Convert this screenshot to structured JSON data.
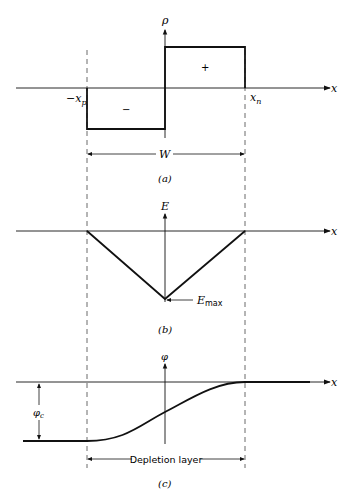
{
  "figure": {
    "panels": [
      {
        "id": "a",
        "caption": "(a)",
        "y_axis_label": "ρ",
        "x_axis_label": "x",
        "left_edge_label": "−x",
        "left_edge_sub": "p",
        "right_edge_label": "x",
        "right_edge_sub": "n",
        "negative_region_sign": "−",
        "positive_region_sign": "+",
        "width_label": "W"
      },
      {
        "id": "b",
        "caption": "(b)",
        "y_axis_label": "E",
        "x_axis_label": "x",
        "peak_label": "E",
        "peak_sub": "max"
      },
      {
        "id": "c",
        "caption": "(c)",
        "y_axis_label": "φ",
        "x_axis_label": "x",
        "potential_label": "φ",
        "potential_sub": "c",
        "region_label": "Depletion layer"
      }
    ]
  }
}
